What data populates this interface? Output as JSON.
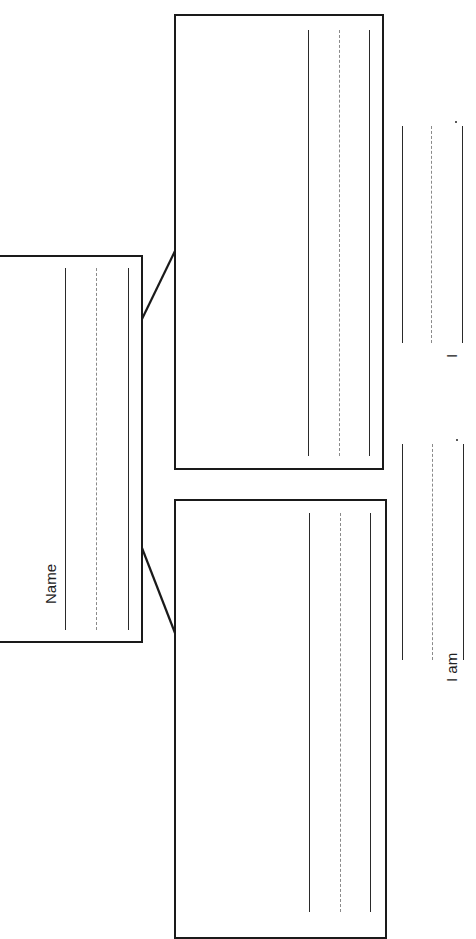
{
  "worksheet": {
    "name_label": "Name",
    "sentence_1_start": "I am",
    "sentence_1_end": ".",
    "sentence_2_start": "I",
    "sentence_2_end": "."
  },
  "boxes": {
    "center_box": {
      "lines": [
        "writing-line",
        "dashed-midline",
        "writing-line"
      ]
    },
    "upper_box": {
      "lines": [
        "writing-line",
        "dashed-midline",
        "writing-line"
      ]
    },
    "lower_box": {
      "lines": [
        "writing-line",
        "dashed-midline",
        "writing-line"
      ]
    }
  },
  "colors": {
    "ink": "#1a1a1a",
    "dashed": "#8a8a8a",
    "paper": "#ffffff"
  }
}
